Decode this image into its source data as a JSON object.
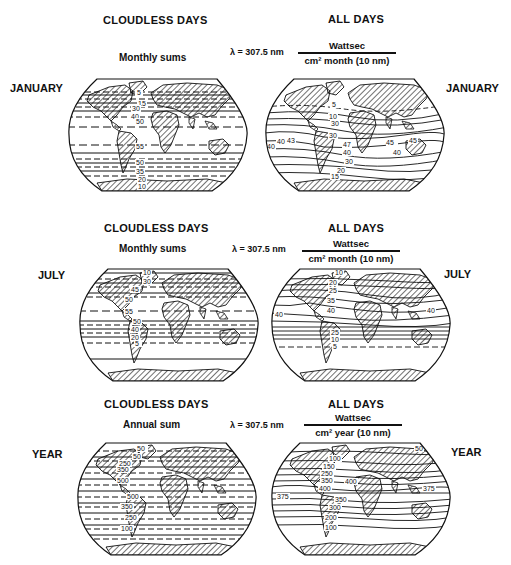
{
  "figure": {
    "panels": [
      {
        "row": "JANUARY",
        "left_header": "CLOUDLESS DAYS",
        "left_sub": "Monthly sums",
        "right_header": "ALL DAYS",
        "wavelength": "λ = 307.5 nm",
        "unit_numerator": "Wattsec",
        "unit_denominator": "cm² month (10 nm)",
        "left_map": {
          "name": "January cloudless days",
          "contour_labels": [
            "5",
            "15",
            "30",
            "40",
            "50",
            "55",
            "50",
            "35",
            "20",
            "10"
          ]
        },
        "right_map": {
          "name": "January all days",
          "contour_labels": [
            "5",
            "10",
            "30",
            "30",
            "40",
            "43",
            "40",
            "45",
            "47",
            "40",
            "45",
            "40",
            "30",
            "20",
            "15"
          ]
        }
      },
      {
        "row": "JULY",
        "left_header": "CLOUDLESS DAYS",
        "left_sub": "Monthly sums",
        "right_header": "ALL DAYS",
        "wavelength": "λ = 307.5 nm",
        "unit_numerator": "Wattsec",
        "unit_denominator": "cm² month (10 nm)",
        "left_map": {
          "name": "July cloudless days",
          "contour_labels": [
            "10",
            "30",
            "45",
            "50",
            "55",
            "50",
            "40",
            "20",
            "5"
          ]
        },
        "right_map": {
          "name": "July all days",
          "contour_labels": [
            "10",
            "20",
            "25",
            "35",
            "40",
            "40",
            "40",
            "25",
            "10",
            "5"
          ]
        }
      },
      {
        "row": "YEAR",
        "left_header": "CLOUDLESS DAYS",
        "left_sub": "Annual sum",
        "right_header": "ALL DAYS",
        "wavelength": "λ = 307.5 nm",
        "unit_numerator": "Wattsec",
        "unit_denominator": "cm² year (10 nm)",
        "left_map": {
          "name": "Annual cloudless days",
          "contour_labels": [
            "50",
            "50",
            "250",
            "350",
            "500",
            "500",
            "350",
            "250",
            "100"
          ]
        },
        "right_map": {
          "name": "Annual all days",
          "contour_labels": [
            "50",
            "100",
            "150",
            "250",
            "350",
            "400",
            "400",
            "375",
            "375",
            "350",
            "300",
            "200",
            "100"
          ]
        }
      }
    ]
  },
  "colors": {
    "ink": "#111111",
    "paper": "#ffffff"
  }
}
